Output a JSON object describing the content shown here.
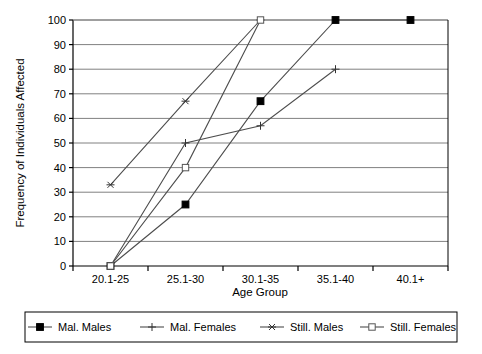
{
  "chart_data": {
    "type": "line",
    "title": "",
    "xlabel": "Age Group",
    "ylabel": "Frequency of Individuals Affected",
    "categories": [
      "20.1-25",
      "25.1-30",
      "30.1-35",
      "35.1-40",
      "40.1+"
    ],
    "ylim": [
      0,
      100
    ],
    "ytick_labels": [
      "0",
      "10",
      "20",
      "30",
      "40",
      "50",
      "60",
      "70",
      "80",
      "90",
      "100"
    ],
    "yticks": [
      0,
      10,
      20,
      30,
      40,
      50,
      60,
      70,
      80,
      90,
      100
    ],
    "grid": "horizontal",
    "legend_position": "bottom",
    "series": [
      {
        "name": "Mal. Males",
        "marker": "filled-square",
        "color": "#000000",
        "x": [
          "20.1-25",
          "25.1-30",
          "30.1-35",
          "35.1-40",
          "40.1+"
        ],
        "values": [
          0,
          25,
          67,
          100,
          100
        ]
      },
      {
        "name": "Mal. Females",
        "marker": "plus",
        "color": "#000000",
        "x": [
          "20.1-25",
          "25.1-30",
          "30.1-35",
          "35.1-40"
        ],
        "values": [
          0,
          50,
          57,
          80
        ]
      },
      {
        "name": "Still. Males",
        "marker": "asterisk",
        "color": "#000000",
        "x": [
          "20.1-25",
          "25.1-30",
          "30.1-35"
        ],
        "values": [
          33,
          67,
          100
        ]
      },
      {
        "name": "Still. Females",
        "marker": "open-square",
        "color": "#000000",
        "x": [
          "20.1-25",
          "25.1-30",
          "30.1-35"
        ],
        "values": [
          0,
          40,
          100
        ]
      }
    ]
  },
  "legend": {
    "items": [
      {
        "label": "Mal. Males",
        "marker": "filled-square"
      },
      {
        "label": "Mal. Females",
        "marker": "plus"
      },
      {
        "label": "Still. Males",
        "marker": "asterisk"
      },
      {
        "label": "Still. Females",
        "marker": "open-square"
      }
    ]
  },
  "colors": {
    "axis": "#000000",
    "grid": "#808080",
    "series": "#4d4d4d",
    "background": "#ffffff"
  }
}
